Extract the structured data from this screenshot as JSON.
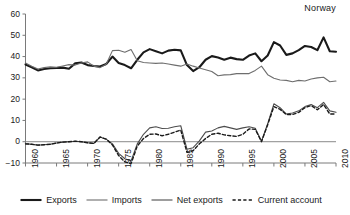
{
  "chart_data": {
    "type": "line",
    "title": "Norway",
    "xlabel": "",
    "ylabel": "",
    "xlim": [
      1960,
      2010
    ],
    "ylim": [
      -10,
      60
    ],
    "grid": false,
    "legend_position": "bottom",
    "ytick_labels": [
      "60",
      "50",
      "40",
      "30",
      "20",
      "10",
      "0",
      "−10"
    ],
    "ytick_values": [
      60,
      50,
      40,
      30,
      20,
      10,
      0,
      -10
    ],
    "xtick_labels": [
      "1960",
      "1965",
      "1970",
      "1975",
      "1980",
      "1985",
      "1990",
      "1995",
      "2000",
      "2005",
      "2010"
    ],
    "xtick_values": [
      1960,
      1965,
      1970,
      1975,
      1980,
      1985,
      1990,
      1995,
      2000,
      2005,
      2010
    ],
    "x": [
      1960,
      1961,
      1962,
      1963,
      1964,
      1965,
      1966,
      1967,
      1968,
      1969,
      1970,
      1971,
      1972,
      1973,
      1974,
      1975,
      1976,
      1977,
      1978,
      1979,
      1980,
      1981,
      1982,
      1983,
      1984,
      1985,
      1986,
      1987,
      1988,
      1989,
      1990,
      1991,
      1992,
      1993,
      1994,
      1995,
      1996,
      1997,
      1998,
      1999,
      2000,
      2001,
      2002,
      2003,
      2004,
      2005,
      2006,
      2007,
      2008,
      2009,
      2010
    ],
    "series": [
      {
        "name": "Exports",
        "color": "#1a1a1a",
        "style": "solid",
        "width": 2.1,
        "values": [
          36.3,
          35.0,
          33.5,
          34.2,
          34.5,
          34.6,
          34.8,
          34.3,
          36.8,
          37.2,
          36.0,
          35.6,
          35.3,
          36.5,
          40.0,
          37.0,
          36.0,
          34.5,
          38.5,
          42.0,
          43.5,
          42.5,
          41.5,
          42.8,
          43.2,
          42.9,
          36.0,
          33.2,
          35.0,
          38.5,
          40.2,
          39.6,
          38.5,
          39.5,
          38.8,
          38.5,
          40.5,
          41.5,
          37.8,
          40.5,
          46.8,
          45.2,
          40.8,
          41.5,
          43.0,
          45.0,
          44.5,
          43.0,
          49.0,
          42.5,
          42.3
        ]
      },
      {
        "name": "Imports",
        "color": "#6e6e6e",
        "style": "solid",
        "width": 1.1,
        "values": [
          37.0,
          35.5,
          34.2,
          34.8,
          35.2,
          35.0,
          35.6,
          36.2,
          36.0,
          37.0,
          37.5,
          35.5,
          34.8,
          36.4,
          42.8,
          43.0,
          42.0,
          43.3,
          38.0,
          37.2,
          37.0,
          36.8,
          37.0,
          36.5,
          36.0,
          35.5,
          36.5,
          35.5,
          34.6,
          33.8,
          33.0,
          31.0,
          31.4,
          31.5,
          32.0,
          32.0,
          32.0,
          33.5,
          35.5,
          31.5,
          29.8,
          29.0,
          28.8,
          28.2,
          28.8,
          28.5,
          29.5,
          30.0,
          30.3,
          28.2,
          28.5
        ]
      },
      {
        "name": "Net exports",
        "color": "#4d4d4d",
        "style": "solid",
        "width": 1.1,
        "values": [
          -1.0,
          -1.2,
          -1.6,
          -1.4,
          -1.2,
          -0.6,
          -0.2,
          0.0,
          0.2,
          0.0,
          -0.5,
          -0.8,
          2.2,
          1.2,
          -1.0,
          -5.5,
          -8.0,
          -9.0,
          -1.0,
          3.5,
          6.5,
          7.0,
          6.2,
          6.3,
          7.0,
          7.5,
          -3.5,
          -2.8,
          0.4,
          4.5,
          5.0,
          6.5,
          7.2,
          6.5,
          5.8,
          6.5,
          7.0,
          6.3,
          0.2,
          8.5,
          17.8,
          16.0,
          13.0,
          13.5,
          14.5,
          16.5,
          17.5,
          16.0,
          18.5,
          14.5,
          13.8
        ]
      },
      {
        "name": "Current account",
        "color": "#1a1a1a",
        "style": "dashed",
        "width": 1.4,
        "values": [
          -1.0,
          -1.2,
          -1.6,
          -1.4,
          -1.2,
          -0.6,
          -0.2,
          0.0,
          0.2,
          0.0,
          -0.5,
          -0.8,
          2.2,
          1.2,
          -1.5,
          -6.5,
          -9.5,
          -10.3,
          -2.0,
          1.5,
          3.5,
          3.6,
          2.8,
          3.5,
          4.5,
          5.5,
          -5.0,
          -4.2,
          -1.0,
          1.5,
          3.5,
          4.0,
          3.2,
          2.8,
          2.5,
          3.5,
          6.0,
          5.8,
          0.0,
          8.0,
          16.5,
          15.2,
          12.8,
          12.8,
          13.8,
          16.0,
          17.0,
          15.0,
          17.5,
          13.0,
          13.0
        ]
      }
    ]
  },
  "legend": {
    "items": [
      {
        "label": "Exports"
      },
      {
        "label": "Imports"
      },
      {
        "label": "Net exports"
      },
      {
        "label": "Current account"
      }
    ]
  }
}
